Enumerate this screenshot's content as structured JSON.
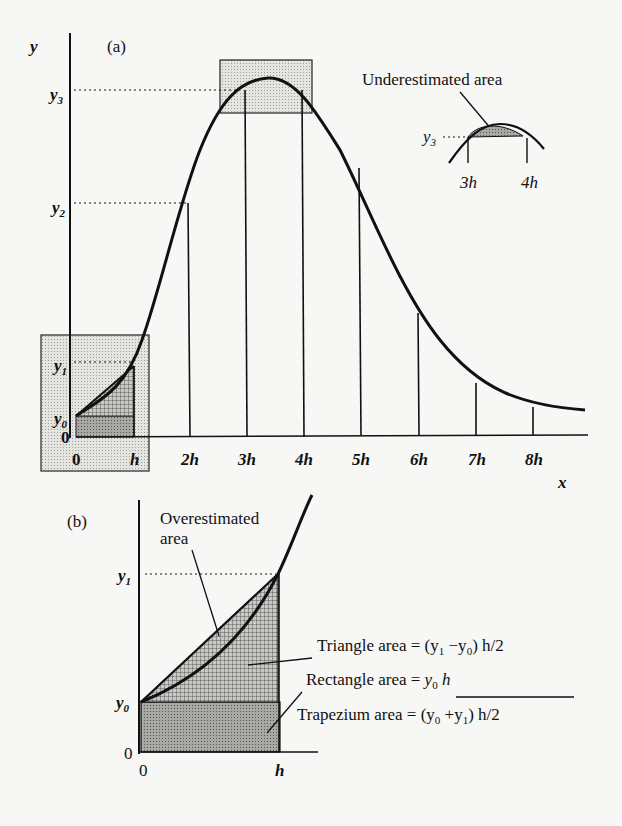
{
  "panel_a": {
    "label": "(a)",
    "y_axis_label": "y",
    "x_axis_label": "x",
    "y_ticks": {
      "y0": "y",
      "y0_sub": "0",
      "y1": "y",
      "y1_sub": "1",
      "y2": "y",
      "y2_sub": "2",
      "y3": "y",
      "y3_sub": "3",
      "zero": "0"
    },
    "x_ticks": [
      "0",
      "h",
      "2h",
      "3h",
      "4h",
      "5h",
      "6h",
      "7h",
      "8h"
    ],
    "inset": {
      "title": "Underestimated area",
      "y_label": "y",
      "y_sub": "3",
      "x_left": "3h",
      "x_right": "4h"
    }
  },
  "panel_b": {
    "label": "(b)",
    "overestimated_label_line1": "Overestimated",
    "overestimated_label_line2": "area",
    "y1": "y",
    "y1_sub": "1",
    "y0": "y",
    "y0_sub": "0",
    "zero_y": "0",
    "zero_x": "0",
    "h_label": "h",
    "triangle_text": "Triangle area = (y",
    "triangle_sub1": "1",
    "triangle_mid": " −y",
    "triangle_sub0": "0",
    "triangle_end": ") h/2",
    "rectangle_text": "Rectangle area = ",
    "rectangle_formula": "y",
    "rectangle_sub": "0",
    "rectangle_end": " h",
    "trapezium_text": "Trapezium area = (y",
    "trapezium_sub0": "0",
    "trapezium_mid": " +y",
    "trapezium_sub1": "1",
    "trapezium_end": ") h/2"
  },
  "colors": {
    "ink": "#111111",
    "shade_light": "#d9d9d6",
    "shade_dark": "#9a9a96",
    "background": "#f7f7f5"
  }
}
